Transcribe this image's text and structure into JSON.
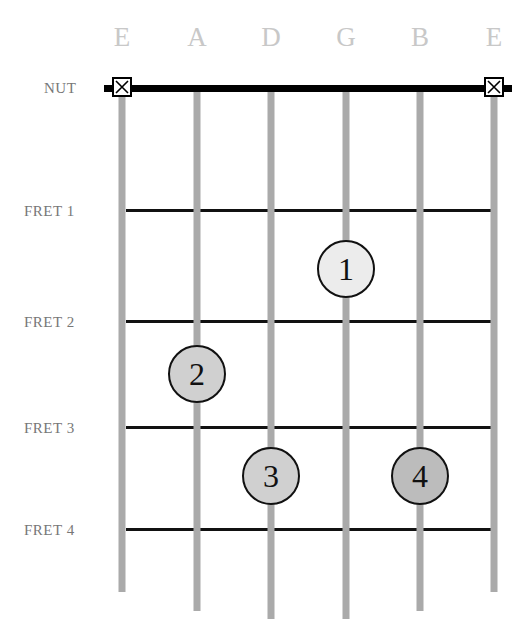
{
  "strings": [
    {
      "name": "E",
      "x": 122,
      "bottom": 592
    },
    {
      "name": "A",
      "x": 197,
      "bottom": 611
    },
    {
      "name": "D",
      "x": 271,
      "bottom": 619
    },
    {
      "name": "G",
      "x": 346,
      "bottom": 619
    },
    {
      "name": "B",
      "x": 420,
      "bottom": 611
    },
    {
      "name": "E",
      "x": 494,
      "bottom": 592
    }
  ],
  "labels": {
    "nut": "NUT",
    "frets": [
      "FRET 1",
      "FRET 2",
      "FRET 3",
      "FRET 4"
    ]
  },
  "fret_y": [
    210,
    321,
    427,
    529
  ],
  "muted_strings": [
    "low-E",
    "high-E"
  ],
  "fingers": [
    {
      "number": "1",
      "string": "G",
      "fret": 1,
      "x": 346,
      "y": 269,
      "fill": "#ececec"
    },
    {
      "number": "2",
      "string": "A",
      "fret": 2,
      "x": 197,
      "y": 374,
      "fill": "#d0d0d0"
    },
    {
      "number": "3",
      "string": "D",
      "fret": 3,
      "x": 271,
      "y": 476,
      "fill": "#d0d0d0"
    },
    {
      "number": "4",
      "string": "B",
      "fret": 3,
      "x": 420,
      "y": 476,
      "fill": "#bcbcbc"
    }
  ]
}
